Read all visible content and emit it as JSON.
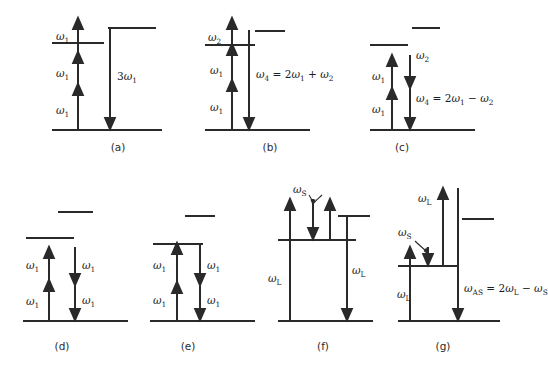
{
  "figure": {
    "type": "energy-level-diagram",
    "background": "#ffffff",
    "line_color": "#2a2a2a",
    "panels": [
      {
        "id": "a",
        "label": "(a)",
        "process": "third-harmonic-generation",
        "absorption_labels": [
          "ω₁",
          "ω₁",
          "ω₁"
        ],
        "emission_label": "3ω₁",
        "equation": "",
        "levels": [
          "ground",
          "virtual",
          "virtual"
        ]
      },
      {
        "id": "b",
        "label": "(b)",
        "process": "sum-frequency-generation",
        "absorption_labels": [
          "ω₁",
          "ω₁",
          "ω₂"
        ],
        "emission_label": "",
        "equation": "ω₄ = 2ω₁ + ω₂",
        "levels": [
          "ground",
          "virtual",
          "virtual"
        ]
      },
      {
        "id": "c",
        "label": "(c)",
        "process": "four-wave-mixing-difference",
        "absorption_labels": [
          "ω₁",
          "ω₁"
        ],
        "emission_label": "ω₂",
        "equation": "ω₄ = 2ω₁ − ω₂",
        "levels": [
          "ground",
          "virtual",
          "virtual"
        ]
      },
      {
        "id": "d",
        "label": "(d)",
        "process": "degenerate-four-wave-mixing",
        "absorption_labels": [
          "ω₁",
          "ω₁"
        ],
        "emission_labels": [
          "ω₁",
          "ω₁"
        ],
        "equation": "",
        "levels": [
          "ground",
          "virtual",
          "virtual"
        ]
      },
      {
        "id": "e",
        "label": "(e)",
        "process": "resonant-degenerate-four-wave-mixing",
        "absorption_labels": [
          "ω₁",
          "ω₁"
        ],
        "emission_labels": [
          "ω₁",
          "ω₁"
        ],
        "equation": "",
        "levels": [
          "ground",
          "resonant",
          "virtual"
        ]
      },
      {
        "id": "f",
        "label": "(f)",
        "process": "stimulated-raman-scattering",
        "pump_labels": [
          "ω",
          "ω"
        ],
        "pump_sub": "L",
        "stokes_label": "ω",
        "stokes_sub": "S",
        "equation": "",
        "levels": [
          "ground",
          "vibrational",
          "virtual"
        ]
      },
      {
        "id": "g",
        "label": "(g)",
        "process": "coherent-anti-stokes-raman-scattering",
        "pump_labels": [
          "ω",
          "ω"
        ],
        "pump_sub": "L",
        "stokes_label": "ω",
        "stokes_sub": "S",
        "equation": "ω",
        "equation_sub": "AS",
        "equation_rest": " = 2ω",
        "equation_sub2": "L",
        "equation_rest2": " − ω",
        "equation_sub3": "S",
        "levels": [
          "ground",
          "vibrational",
          "virtual"
        ]
      }
    ]
  }
}
